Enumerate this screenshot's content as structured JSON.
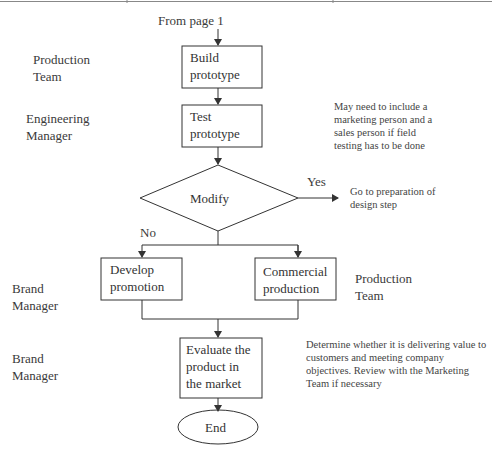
{
  "diagram": {
    "type": "flowchart",
    "colors": {
      "line": "#333333",
      "text": "#3a3a3a",
      "background": "#ffffff"
    },
    "entry": "From page 1",
    "roles": [
      {
        "id": "role-build",
        "text": "Production\nTeam"
      },
      {
        "id": "role-test",
        "text": "Engineering\nManager"
      },
      {
        "id": "role-promotion",
        "text": "Brand\nManager"
      },
      {
        "id": "role-commercial",
        "text": "Production\nTeam"
      },
      {
        "id": "role-evaluate",
        "text": "Brand\nManager"
      }
    ],
    "nodes": [
      {
        "id": "build-prototype",
        "shape": "rectangle",
        "text": "Build\nprototype"
      },
      {
        "id": "test-prototype",
        "shape": "rectangle",
        "text": "Test\nprototype"
      },
      {
        "id": "modify",
        "shape": "diamond",
        "text": "Modify"
      },
      {
        "id": "develop-promotion",
        "shape": "rectangle",
        "text": "Develop\npromotion"
      },
      {
        "id": "commercial-production",
        "shape": "rectangle",
        "text": "Commercial\nproduction"
      },
      {
        "id": "evaluate",
        "shape": "rectangle",
        "text": "Evaluate the\nproduct in\nthe market"
      },
      {
        "id": "end",
        "shape": "ellipse",
        "text": "End"
      }
    ],
    "edges": [
      {
        "from": "entry",
        "to": "build-prototype"
      },
      {
        "from": "build-prototype",
        "to": "test-prototype"
      },
      {
        "from": "test-prototype",
        "to": "modify"
      },
      {
        "from": "modify",
        "to": "go-to-design",
        "label": "Yes"
      },
      {
        "from": "modify",
        "to": "develop-promotion",
        "label": "No"
      },
      {
        "from": "modify",
        "to": "commercial-production",
        "label": "No"
      },
      {
        "from": "develop-promotion",
        "to": "evaluate"
      },
      {
        "from": "commercial-production",
        "to": "evaluate"
      },
      {
        "from": "evaluate",
        "to": "end"
      }
    ],
    "labels": {
      "yes": "Yes",
      "no": "No"
    },
    "notes": {
      "test": "May need to include a\nmarketing person and a\nsales person if field\ntesting has to be done",
      "yes_target": "Go to preparation of\ndesign step",
      "evaluate": "Determine whether it is delivering value to\ncustomers and meeting company\nobjectives. Review with the Marketing\nTeam if necessary"
    }
  }
}
